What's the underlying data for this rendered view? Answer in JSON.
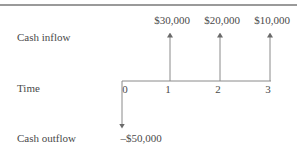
{
  "diagram": {
    "row_labels": {
      "inflow": "Cash inflow",
      "time": "Time",
      "outflow": "Cash outflow"
    },
    "periods": [
      {
        "t": "0",
        "flow": "outflow",
        "label": "–$50,000",
        "amount": -50000
      },
      {
        "t": "1",
        "flow": "inflow",
        "label": "$30,000",
        "amount": 30000
      },
      {
        "t": "2",
        "flow": "inflow",
        "label": "$20,000",
        "amount": 20000
      },
      {
        "t": "3",
        "flow": "inflow",
        "label": "$10,000",
        "amount": 10000
      }
    ],
    "colors": {
      "line": "#8a8a8a",
      "text": "#4a4a4a",
      "rule": "#9a9a9a"
    }
  }
}
